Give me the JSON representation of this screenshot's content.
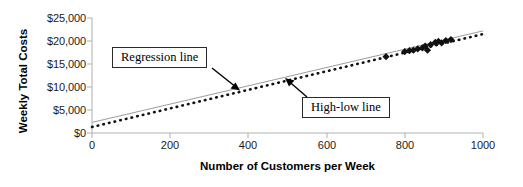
{
  "chart_data": {
    "type": "scatter",
    "title": "",
    "xlabel": "Number of Customers per Week",
    "ylabel": "Weekly Total Costs",
    "xlim": [
      0,
      1000
    ],
    "ylim": [
      0,
      25000
    ],
    "grid": false,
    "legend": "none",
    "x_ticks": [
      0,
      200,
      400,
      600,
      800,
      1000
    ],
    "x_tick_labels": [
      "0",
      "200",
      "400",
      "600",
      "800",
      "1000"
    ],
    "y_ticks": [
      0,
      5000,
      10000,
      15000,
      20000,
      25000
    ],
    "y_tick_labels": [
      "$0",
      "$5,000",
      "$10,000",
      "$15,000",
      "$20,000",
      "$25,000"
    ],
    "series": [
      {
        "name": "Weekly observations",
        "type": "scatter",
        "marker": "diamond",
        "color": "#111111",
        "points": [
          {
            "x": 752,
            "y": 16600
          },
          {
            "x": 800,
            "y": 17700
          },
          {
            "x": 812,
            "y": 17900
          },
          {
            "x": 822,
            "y": 18000
          },
          {
            "x": 833,
            "y": 18300
          },
          {
            "x": 845,
            "y": 18500
          },
          {
            "x": 852,
            "y": 18900
          },
          {
            "x": 858,
            "y": 18000
          },
          {
            "x": 866,
            "y": 19200
          },
          {
            "x": 878,
            "y": 19700
          },
          {
            "x": 886,
            "y": 19900
          },
          {
            "x": 894,
            "y": 19600
          },
          {
            "x": 905,
            "y": 20100
          },
          {
            "x": 918,
            "y": 20300
          }
        ]
      },
      {
        "name": "Regression line",
        "type": "line",
        "style": "dotted",
        "color": "#111111",
        "intercept": 1300,
        "slope": 20.2,
        "x_from": 0,
        "x_to": 1000,
        "y_from": 1300,
        "y_to": 21500
      },
      {
        "name": "High-low line",
        "type": "line",
        "style": "solid",
        "color": "#9a9a9a",
        "intercept": 2300,
        "slope": 19.9,
        "x_from": 0,
        "x_to": 1000,
        "y_from": 2300,
        "y_to": 22200
      }
    ],
    "annotations": [
      {
        "name": "regression-line-callout",
        "text": "Regression line",
        "box_x": 112,
        "box_y": 47,
        "arrow_from": [
          212,
          68
        ],
        "arrow_to": [
          238,
          89
        ]
      },
      {
        "name": "high-low-line-callout",
        "text": "High-low line",
        "box_x": 302,
        "box_y": 97,
        "arrow_from": [
          306,
          97
        ],
        "arrow_to": [
          286,
          79
        ]
      }
    ]
  },
  "axes": {
    "y_title": "Weekly Total Costs",
    "x_title": "Number of Customers per Week"
  },
  "callouts": {
    "regression": "Regression line",
    "high_low": "High-low line"
  }
}
